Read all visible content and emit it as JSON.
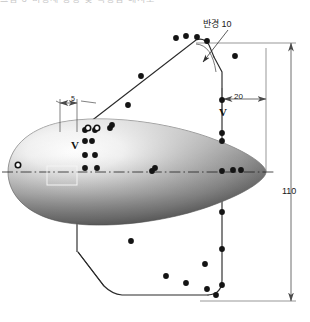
{
  "figure": {
    "top_strip_text": "그림 3  비행체 형상 및 측정점 배치도",
    "type": "engineering-drawing"
  },
  "annotations": {
    "radius_label": "반경 10",
    "width_label": "20",
    "offset_label": "5",
    "height_label": "110",
    "marker_left": "V",
    "marker_right": "V"
  },
  "colors": {
    "line": "#2b2b2b",
    "dimension": "#6b6b6b",
    "body_light": "#f2f2f2",
    "body_mid": "#9d9d9d",
    "body_dark": "#5e5e5e",
    "point_fill": "#141414",
    "point_hollow": "#ffffff",
    "background": "#ffffff"
  },
  "geometry": {
    "centerline_y": 172,
    "body_left_x": 8,
    "body_right_x": 266,
    "apex_x": 207,
    "apex_y": 41,
    "vertical_line_x": 222,
    "bottom_y": 297
  },
  "measurement_points": {
    "filled": [
      [
        176,
        38
      ],
      [
        186,
        36
      ],
      [
        197,
        37
      ],
      [
        207,
        41
      ],
      [
        235,
        56
      ],
      [
        222,
        100
      ],
      [
        222,
        133
      ],
      [
        222,
        141
      ],
      [
        222,
        171
      ],
      [
        222,
        212
      ],
      [
        222,
        249
      ],
      [
        222,
        285
      ],
      [
        233,
        170
      ],
      [
        241,
        170
      ],
      [
        152,
        171
      ],
      [
        155,
        168
      ],
      [
        85,
        130
      ],
      [
        95,
        130
      ],
      [
        110,
        128
      ],
      [
        85,
        141
      ],
      [
        92,
        141
      ],
      [
        85,
        155
      ],
      [
        95,
        155
      ],
      [
        85,
        168
      ],
      [
        97,
        168
      ],
      [
        141,
        76
      ],
      [
        128,
        105
      ],
      [
        112,
        125
      ],
      [
        131,
        241
      ],
      [
        166,
        276
      ],
      [
        186,
        283
      ],
      [
        207,
        289
      ],
      [
        205,
        264
      ],
      [
        216,
        295
      ]
    ],
    "hollow": [
      [
        18,
        165
      ],
      [
        88,
        128
      ],
      [
        97,
        128
      ]
    ]
  }
}
